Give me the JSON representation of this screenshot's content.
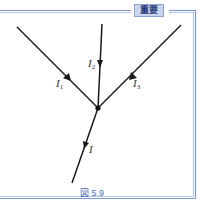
{
  "badge": {
    "label": "重要"
  },
  "figure": {
    "caption": "図 5.9",
    "junction": {
      "x": 98,
      "y": 108
    },
    "branches": [
      {
        "id": "I1",
        "symbol": "I",
        "subscript": "1",
        "direction": "into-junction"
      },
      {
        "id": "I2",
        "symbol": "I",
        "subscript": "2",
        "direction": "into-junction"
      },
      {
        "id": "I3",
        "symbol": "I",
        "subscript": "3",
        "direction": "into-junction"
      },
      {
        "id": "I",
        "symbol": "I",
        "subscript": "",
        "direction": "out-of-junction"
      }
    ]
  },
  "colors": {
    "frame_outer": "#7f97cc",
    "frame_inner": "#b9c8e6",
    "line": "#1a1a1a",
    "caption": "#4a6fb5",
    "badge_bg": "#c9d5ea"
  }
}
